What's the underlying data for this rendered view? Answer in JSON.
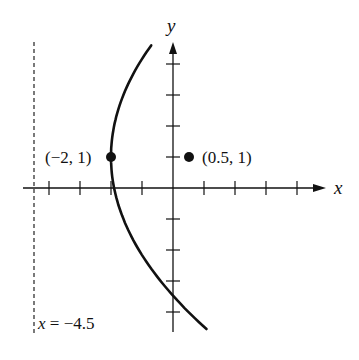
{
  "chart_data": {
    "type": "line",
    "title": "",
    "xlabel": "x",
    "ylabel": "y",
    "grid": false,
    "xlim": [
      -4.8,
      5
    ],
    "ylim": [
      -4.6,
      5
    ],
    "tick_spacing": 1,
    "series": [
      {
        "name": "parabola",
        "equation": "(y - 1)^2 = 10(x + 2)",
        "vertex": [
          -2,
          1
        ],
        "focus": [
          0.5,
          1
        ],
        "directrix": "x = -4.5",
        "y_range": [
          -4.55,
          4.6
        ]
      }
    ],
    "points": [
      {
        "label": "(−2, 1)",
        "x": -2,
        "y": 1
      },
      {
        "label": "(0.5, 1)",
        "x": 0.5,
        "y": 1
      }
    ],
    "annotations": [
      {
        "text": "x = −4.5",
        "type": "directrix",
        "style": "dashed"
      }
    ]
  },
  "labels": {
    "x_axis": "x",
    "y_axis": "y",
    "vertex": "(−2, 1)",
    "focus": "(0.5, 1)",
    "directrix_eq_var": "x",
    "directrix_eq_rest": " = −4.5"
  },
  "colors": {
    "ink": "#111111",
    "background": "#ffffff"
  }
}
